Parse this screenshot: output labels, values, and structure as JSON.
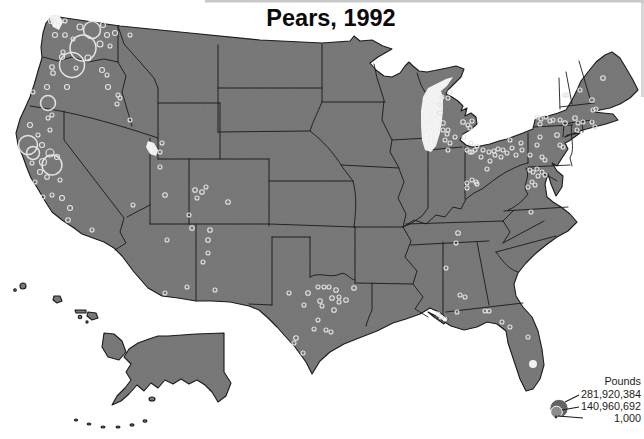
{
  "title": "Pears, 1992",
  "legend": {
    "unit_label": "Pounds",
    "entries": [
      {
        "value": "281,920,384"
      },
      {
        "value": "140,960,692"
      },
      {
        "value": "1,000"
      }
    ]
  },
  "colors": {
    "land": "#7d7d7d",
    "water": "#ffffff",
    "state_border": "#151515",
    "bubble_outline": "#e4e4e4",
    "title_text": "#0a0a0a",
    "legend_text": "#1c1c1c"
  },
  "chart_data": {
    "type": "bubble-map",
    "title": "Pears, 1992",
    "region": "United States (contiguous states with Alaska and Hawaii insets)",
    "unit": "Pounds",
    "legend_values": [
      281920384,
      140960692,
      1000
    ],
    "points": [
      [
        51,
        21,
        2.5
      ],
      [
        65,
        21,
        2
      ],
      [
        80,
        27,
        3
      ],
      [
        92,
        30,
        8.5
      ],
      [
        103,
        25,
        2.5
      ],
      [
        107,
        35,
        2.5
      ],
      [
        115,
        33,
        2.5
      ],
      [
        55,
        35,
        2.5
      ],
      [
        65,
        35,
        2.3
      ],
      [
        73,
        39,
        2
      ],
      [
        83,
        48,
        13
      ],
      [
        110,
        46,
        2
      ],
      [
        100,
        44,
        3
      ],
      [
        88,
        58,
        3
      ],
      [
        63,
        52,
        2
      ],
      [
        62,
        57,
        2.5
      ],
      [
        72,
        65,
        12.5
      ],
      [
        76,
        68,
        2
      ],
      [
        102,
        70,
        2.5
      ],
      [
        107,
        75,
        2
      ],
      [
        118,
        95,
        2
      ],
      [
        120,
        98,
        2
      ],
      [
        117,
        104,
        2
      ],
      [
        52,
        67,
        2.3
      ],
      [
        53,
        73,
        2.3
      ],
      [
        47,
        87,
        2.5
      ],
      [
        67,
        87,
        2.5
      ],
      [
        108,
        87,
        2.5
      ],
      [
        33,
        92,
        2
      ],
      [
        48,
        103,
        7.5
      ],
      [
        52,
        115,
        2
      ],
      [
        130,
        35,
        2
      ],
      [
        130,
        120,
        2
      ],
      [
        162,
        143,
        2
      ],
      [
        48,
        118,
        2
      ],
      [
        30,
        125,
        2.5
      ],
      [
        50,
        130,
        2
      ],
      [
        38,
        135,
        2
      ],
      [
        28,
        145,
        9.5
      ],
      [
        42,
        145,
        2.5
      ],
      [
        33,
        153,
        6.5
      ],
      [
        50,
        153,
        4
      ],
      [
        57,
        157,
        2.5
      ],
      [
        32,
        163,
        2
      ],
      [
        43,
        162,
        3.5
      ],
      [
        52,
        165,
        10
      ],
      [
        40,
        172,
        2.5
      ],
      [
        47,
        177,
        2.3
      ],
      [
        60,
        180,
        2
      ],
      [
        35,
        182,
        2
      ],
      [
        43,
        197,
        2
      ],
      [
        52,
        195,
        2
      ],
      [
        62,
        198,
        2.5
      ],
      [
        70,
        208,
        2.5
      ],
      [
        68,
        220,
        2.3
      ],
      [
        92,
        230,
        2
      ],
      [
        133,
        205,
        2
      ],
      [
        160,
        152,
        2
      ],
      [
        160,
        167,
        2
      ],
      [
        165,
        195,
        2.3
      ],
      [
        167,
        240,
        2
      ],
      [
        203,
        262,
        2
      ],
      [
        208,
        253,
        2
      ],
      [
        165,
        293,
        2
      ],
      [
        187,
        287,
        2
      ],
      [
        195,
        190,
        2.3
      ],
      [
        202,
        192,
        2.3
      ],
      [
        197,
        198,
        2
      ],
      [
        206,
        187,
        2
      ],
      [
        228,
        202,
        2.3
      ],
      [
        189,
        215,
        2
      ],
      [
        192,
        228,
        2.3
      ],
      [
        210,
        230,
        2.3
      ],
      [
        208,
        240,
        2.3
      ],
      [
        215,
        290,
        2
      ],
      [
        354,
        288,
        2.3
      ],
      [
        318,
        287,
        2
      ],
      [
        324,
        287,
        2
      ],
      [
        329,
        287,
        2
      ],
      [
        336,
        290,
        2.3
      ],
      [
        289,
        293,
        2
      ],
      [
        308,
        293,
        2.3
      ],
      [
        320,
        301,
        2.3
      ],
      [
        332,
        298,
        2.3
      ],
      [
        339,
        297,
        2
      ],
      [
        339,
        302,
        2
      ],
      [
        346,
        300,
        2.3
      ],
      [
        304,
        305,
        2
      ],
      [
        322,
        306,
        2
      ],
      [
        334,
        310,
        2.3
      ],
      [
        318,
        320,
        2
      ],
      [
        314,
        329,
        2
      ],
      [
        326,
        330,
        2
      ],
      [
        331,
        332,
        2
      ],
      [
        296,
        338,
        2.3
      ],
      [
        294,
        343,
        2
      ],
      [
        303,
        353,
        2
      ],
      [
        438,
        314,
        2
      ],
      [
        446,
        268,
        2
      ],
      [
        460,
        295,
        2
      ],
      [
        465,
        297,
        2
      ],
      [
        457,
        312,
        2
      ],
      [
        441,
        317,
        2
      ],
      [
        445,
        319,
        2
      ],
      [
        458,
        233,
        2.3
      ],
      [
        456,
        243,
        2
      ],
      [
        485,
        311,
        2
      ],
      [
        489,
        311,
        2
      ],
      [
        502,
        322,
        2
      ],
      [
        510,
        327,
        2
      ],
      [
        528,
        337,
        2
      ],
      [
        442,
        97,
        2
      ],
      [
        448,
        98,
        2
      ],
      [
        450,
        92,
        2
      ],
      [
        440,
        105,
        2
      ],
      [
        440,
        113,
        2.3
      ],
      [
        443,
        123,
        2.3
      ],
      [
        448,
        130,
        2
      ],
      [
        443,
        130,
        2
      ],
      [
        445,
        140,
        2
      ],
      [
        450,
        143,
        2
      ],
      [
        448,
        150,
        2
      ],
      [
        463,
        122,
        2.3
      ],
      [
        468,
        125,
        2
      ],
      [
        472,
        121,
        2
      ],
      [
        470,
        128,
        2
      ],
      [
        467,
        150,
        2
      ],
      [
        470,
        152,
        2
      ],
      [
        475,
        150,
        2
      ],
      [
        447,
        134,
        2
      ],
      [
        455,
        137,
        2
      ],
      [
        464,
        137,
        2
      ],
      [
        471,
        143,
        2
      ],
      [
        477,
        146,
        2
      ],
      [
        483,
        150,
        2
      ],
      [
        489,
        152,
        2
      ],
      [
        495,
        155,
        2
      ],
      [
        501,
        157,
        2
      ],
      [
        507,
        153,
        2
      ],
      [
        490,
        161,
        2
      ],
      [
        487,
        169,
        2
      ],
      [
        481,
        157,
        2
      ],
      [
        472,
        152,
        2
      ],
      [
        467,
        183,
        2
      ],
      [
        476,
        182,
        2
      ],
      [
        467,
        188,
        2
      ],
      [
        472,
        180,
        2
      ],
      [
        477,
        184,
        2
      ],
      [
        532,
        182,
        2
      ],
      [
        535,
        185,
        2
      ],
      [
        530,
        170,
        2
      ],
      [
        533,
        172,
        2
      ],
      [
        528,
        187,
        2
      ],
      [
        531,
        212,
        2
      ],
      [
        537,
        169,
        2
      ],
      [
        542,
        172,
        2
      ],
      [
        538,
        176,
        2
      ],
      [
        545,
        175,
        2
      ],
      [
        510,
        140,
        2
      ],
      [
        512,
        148,
        2
      ],
      [
        503,
        150,
        2
      ],
      [
        498,
        149,
        2
      ],
      [
        494,
        151,
        2
      ],
      [
        521,
        143,
        2
      ],
      [
        537,
        145,
        2
      ],
      [
        540,
        137,
        2
      ],
      [
        542,
        157,
        2
      ],
      [
        545,
        160,
        2
      ],
      [
        522,
        150,
        2
      ],
      [
        530,
        155,
        2
      ],
      [
        516,
        155,
        2
      ],
      [
        537,
        117,
        2
      ],
      [
        541,
        119,
        2
      ],
      [
        546,
        117,
        2
      ],
      [
        550,
        121,
        2
      ],
      [
        540,
        124,
        2
      ],
      [
        553,
        120,
        2
      ],
      [
        560,
        120,
        2
      ],
      [
        565,
        123,
        2.3
      ],
      [
        575,
        118,
        2.3
      ],
      [
        578,
        123,
        2
      ],
      [
        583,
        122,
        2
      ],
      [
        565,
        95,
        2
      ],
      [
        580,
        90,
        2
      ],
      [
        592,
        100,
        2.3
      ],
      [
        593,
        110,
        2
      ],
      [
        596,
        109,
        2
      ],
      [
        592,
        122,
        2
      ],
      [
        595,
        127,
        2
      ],
      [
        577,
        130,
        2
      ],
      [
        557,
        135,
        2.3
      ],
      [
        560,
        145,
        2
      ],
      [
        563,
        147,
        2
      ],
      [
        603,
        78,
        2.3
      ],
      [
        567,
        95,
        2
      ]
    ]
  }
}
